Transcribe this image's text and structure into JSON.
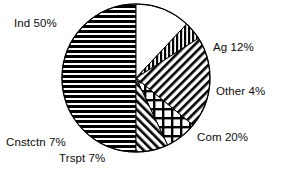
{
  "chart_data": {
    "type": "pie",
    "title": "",
    "subtitle": "",
    "xlabel": "",
    "ylabel": "",
    "legend_position": "none",
    "grid": false,
    "labels_inline": true,
    "units": "percent",
    "total": 100,
    "start_angle_deg": -90,
    "direction": "clockwise",
    "categories": [
      "Ag",
      "Other",
      "Com",
      "Trspt",
      "Cnstctn",
      "Ind"
    ],
    "values": [
      12,
      4,
      20,
      7,
      7,
      50
    ],
    "slices": [
      {
        "name": "Ag",
        "label": "Ag 12%",
        "value": 12,
        "fill": "white",
        "pattern": "none",
        "color": "#ffffff",
        "stroke": "#000000"
      },
      {
        "name": "Other",
        "label": "Other 4%",
        "value": 4,
        "fill": "pattern",
        "pattern": "vertical-lines",
        "color": "#000000",
        "stroke": "#000000"
      },
      {
        "name": "Com",
        "label": "Com 20%",
        "value": 20,
        "fill": "pattern",
        "pattern": "diagonal-backslash",
        "color": "#000000",
        "stroke": "#000000"
      },
      {
        "name": "Trspt",
        "label": "Trspt 7%",
        "value": 7,
        "fill": "pattern",
        "pattern": "crosshatch",
        "color": "#000000",
        "stroke": "#000000"
      },
      {
        "name": "Cnstctn",
        "label": "Cnstctn 7%",
        "value": 7,
        "fill": "pattern",
        "pattern": "diagonal-slash",
        "color": "#000000",
        "stroke": "#000000"
      },
      {
        "name": "Ind",
        "label": "Ind 50%",
        "value": 50,
        "fill": "pattern",
        "pattern": "horizontal-lines",
        "color": "#000000",
        "stroke": "#000000"
      }
    ],
    "annotations": [
      {
        "key": "ind",
        "text": "Ind 50%"
      },
      {
        "key": "ag",
        "text": "Ag 12%"
      },
      {
        "key": "other",
        "text": "Other 4%"
      },
      {
        "key": "com",
        "text": "Com 20%"
      },
      {
        "key": "cnstctn",
        "text": "Cnstctn 7%"
      },
      {
        "key": "trspt",
        "text": "Trspt 7%"
      }
    ]
  },
  "labels": {
    "ind": "Ind 50%",
    "ag": "Ag 12%",
    "other": "Other 4%",
    "com": "Com 20%",
    "cnstctn": "Cnstctn 7%",
    "trspt": "Trspt 7%"
  },
  "geometry": {
    "center_x": 136,
    "center_y": 78,
    "radius": 74
  },
  "colors": {
    "background": "#ffffff",
    "ink": "#000000",
    "text": "#0d0d0d"
  }
}
